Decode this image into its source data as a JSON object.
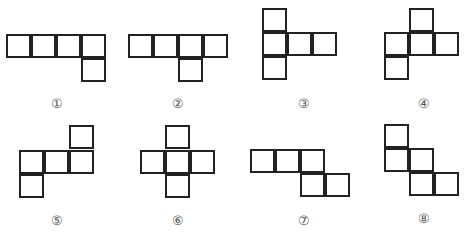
{
  "figures": [
    {
      "label": "①",
      "cells": [
        [
          6,
          34
        ],
        [
          31,
          34
        ],
        [
          56,
          34
        ],
        [
          81,
          34
        ],
        [
          81,
          58
        ]
      ],
      "label_pos": [
        57,
        103
      ]
    },
    {
      "label": "②",
      "cells": [
        [
          128,
          34
        ],
        [
          153,
          34
        ],
        [
          178,
          34
        ],
        [
          203,
          34
        ],
        [
          178,
          58
        ]
      ],
      "label_pos": [
        178,
        103
      ]
    },
    {
      "label": "③",
      "cells": [
        [
          262,
          8
        ],
        [
          262,
          32
        ],
        [
          287,
          32
        ],
        [
          312,
          32
        ],
        [
          262,
          56
        ]
      ],
      "label_pos": [
        304,
        103
      ]
    },
    {
      "label": "④",
      "cells": [
        [
          409,
          8
        ],
        [
          384,
          32
        ],
        [
          409,
          32
        ],
        [
          434,
          32
        ],
        [
          384,
          56
        ]
      ],
      "label_pos": [
        424,
        103
      ]
    },
    {
      "label": "⑤",
      "cells": [
        [
          69,
          125
        ],
        [
          19,
          150
        ],
        [
          44,
          150
        ],
        [
          69,
          150
        ],
        [
          19,
          174
        ]
      ],
      "label_pos": [
        57,
        220
      ]
    },
    {
      "label": "⑥",
      "cells": [
        [
          165,
          125
        ],
        [
          140,
          150
        ],
        [
          165,
          150
        ],
        [
          190,
          150
        ],
        [
          165,
          174
        ]
      ],
      "label_pos": [
        178,
        220
      ]
    },
    {
      "label": "⑦",
      "cells": [
        [
          250,
          149
        ],
        [
          275,
          149
        ],
        [
          300,
          149
        ],
        [
          300,
          173
        ],
        [
          325,
          173
        ]
      ],
      "label_pos": [
        304,
        220
      ]
    },
    {
      "label": "⑧",
      "cells": [
        [
          384,
          124
        ],
        [
          384,
          148
        ],
        [
          409,
          148
        ],
        [
          409,
          172
        ],
        [
          434,
          172
        ]
      ],
      "label_pos": [
        424,
        218
      ]
    }
  ],
  "style": {
    "line_color": "#222222",
    "label_color": "#555555"
  }
}
